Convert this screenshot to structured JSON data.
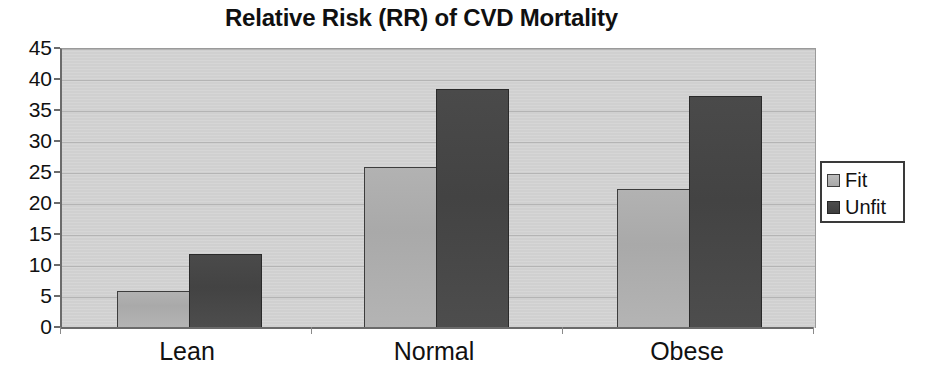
{
  "chart_data": {
    "type": "bar",
    "title": "Relative Risk (RR) of CVD Mortality",
    "xlabel": "",
    "ylabel": "",
    "categories": [
      "Lean",
      "Normal",
      "Obese"
    ],
    "series": [
      {
        "name": "Fit",
        "values": [
          6,
          26,
          22.5
        ],
        "color": "#b0b0b0"
      },
      {
        "name": "Unfit",
        "values": [
          12,
          38.5,
          37.5
        ],
        "color": "#474747"
      }
    ],
    "ylim": [
      0,
      45
    ],
    "ytick_labels": [
      "45",
      "40",
      "35",
      "30",
      "25",
      "20",
      "15",
      "10",
      "5",
      "0"
    ],
    "ytick_values": [
      45,
      40,
      35,
      30,
      25,
      20,
      15,
      10,
      5,
      0
    ],
    "grid": true,
    "legend_position": "right",
    "plot_background": "#d2d2d2"
  },
  "legend": {
    "entries": [
      {
        "label": "Fit",
        "swatch": "legend-swatch-fit"
      },
      {
        "label": "Unfit",
        "swatch": "legend-swatch-unfit"
      }
    ]
  }
}
